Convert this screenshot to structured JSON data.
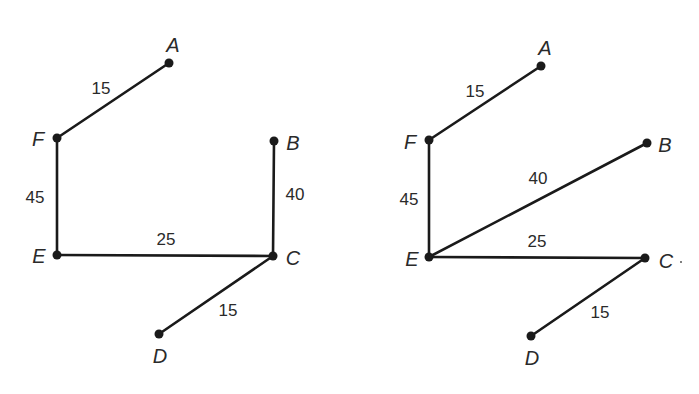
{
  "diagrams": [
    {
      "name": "tree-left",
      "nodes": [
        {
          "id": "A",
          "x": 169,
          "y": 63,
          "lx": 173,
          "ly": 52,
          "anchor": "middle"
        },
        {
          "id": "F",
          "x": 57,
          "y": 138,
          "lx": 38,
          "ly": 146,
          "anchor": "middle"
        },
        {
          "id": "B",
          "x": 274,
          "y": 141,
          "lx": 293,
          "ly": 150,
          "anchor": "middle"
        },
        {
          "id": "E",
          "x": 57,
          "y": 255,
          "lx": 39,
          "ly": 263,
          "anchor": "middle"
        },
        {
          "id": "C",
          "x": 273,
          "y": 256,
          "lx": 293,
          "ly": 265,
          "anchor": "middle"
        },
        {
          "id": "D",
          "x": 159,
          "y": 334,
          "lx": 160,
          "ly": 363,
          "anchor": "middle"
        }
      ],
      "edges": [
        {
          "from": "F",
          "to": "A",
          "weight": "15",
          "wx": 101,
          "wy": 94
        },
        {
          "from": "F",
          "to": "E",
          "weight": "45",
          "wx": 35,
          "wy": 203
        },
        {
          "from": "B",
          "to": "C",
          "weight": "40",
          "wx": 295,
          "wy": 200
        },
        {
          "from": "E",
          "to": "C",
          "weight": "25",
          "wx": 166,
          "wy": 245
        },
        {
          "from": "C",
          "to": "D",
          "weight": "15",
          "wx": 228,
          "wy": 316
        }
      ]
    },
    {
      "name": "tree-right",
      "nodes": [
        {
          "id": "A",
          "x": 541,
          "y": 66,
          "lx": 545,
          "ly": 55,
          "anchor": "middle"
        },
        {
          "id": "F",
          "x": 429,
          "y": 140,
          "lx": 410,
          "ly": 149,
          "anchor": "middle"
        },
        {
          "id": "B",
          "x": 647,
          "y": 143,
          "lx": 665,
          "ly": 152,
          "anchor": "middle"
        },
        {
          "id": "E",
          "x": 429,
          "y": 257,
          "lx": 412,
          "ly": 266,
          "anchor": "middle"
        },
        {
          "id": "C",
          "x": 645,
          "y": 258,
          "lx": 666,
          "ly": 268,
          "anchor": "middle"
        },
        {
          "id": "D",
          "x": 531,
          "y": 336,
          "lx": 532,
          "ly": 365,
          "anchor": "middle"
        }
      ],
      "edges": [
        {
          "from": "F",
          "to": "A",
          "weight": "15",
          "wx": 475,
          "wy": 97
        },
        {
          "from": "F",
          "to": "E",
          "weight": "45",
          "wx": 409,
          "wy": 205
        },
        {
          "from": "E",
          "to": "B",
          "weight": "40",
          "wx": 538,
          "wy": 184
        },
        {
          "from": "E",
          "to": "C",
          "weight": "25",
          "wx": 537,
          "wy": 247
        },
        {
          "from": "C",
          "to": "D",
          "weight": "15",
          "wx": 600,
          "wy": 318
        }
      ]
    }
  ]
}
